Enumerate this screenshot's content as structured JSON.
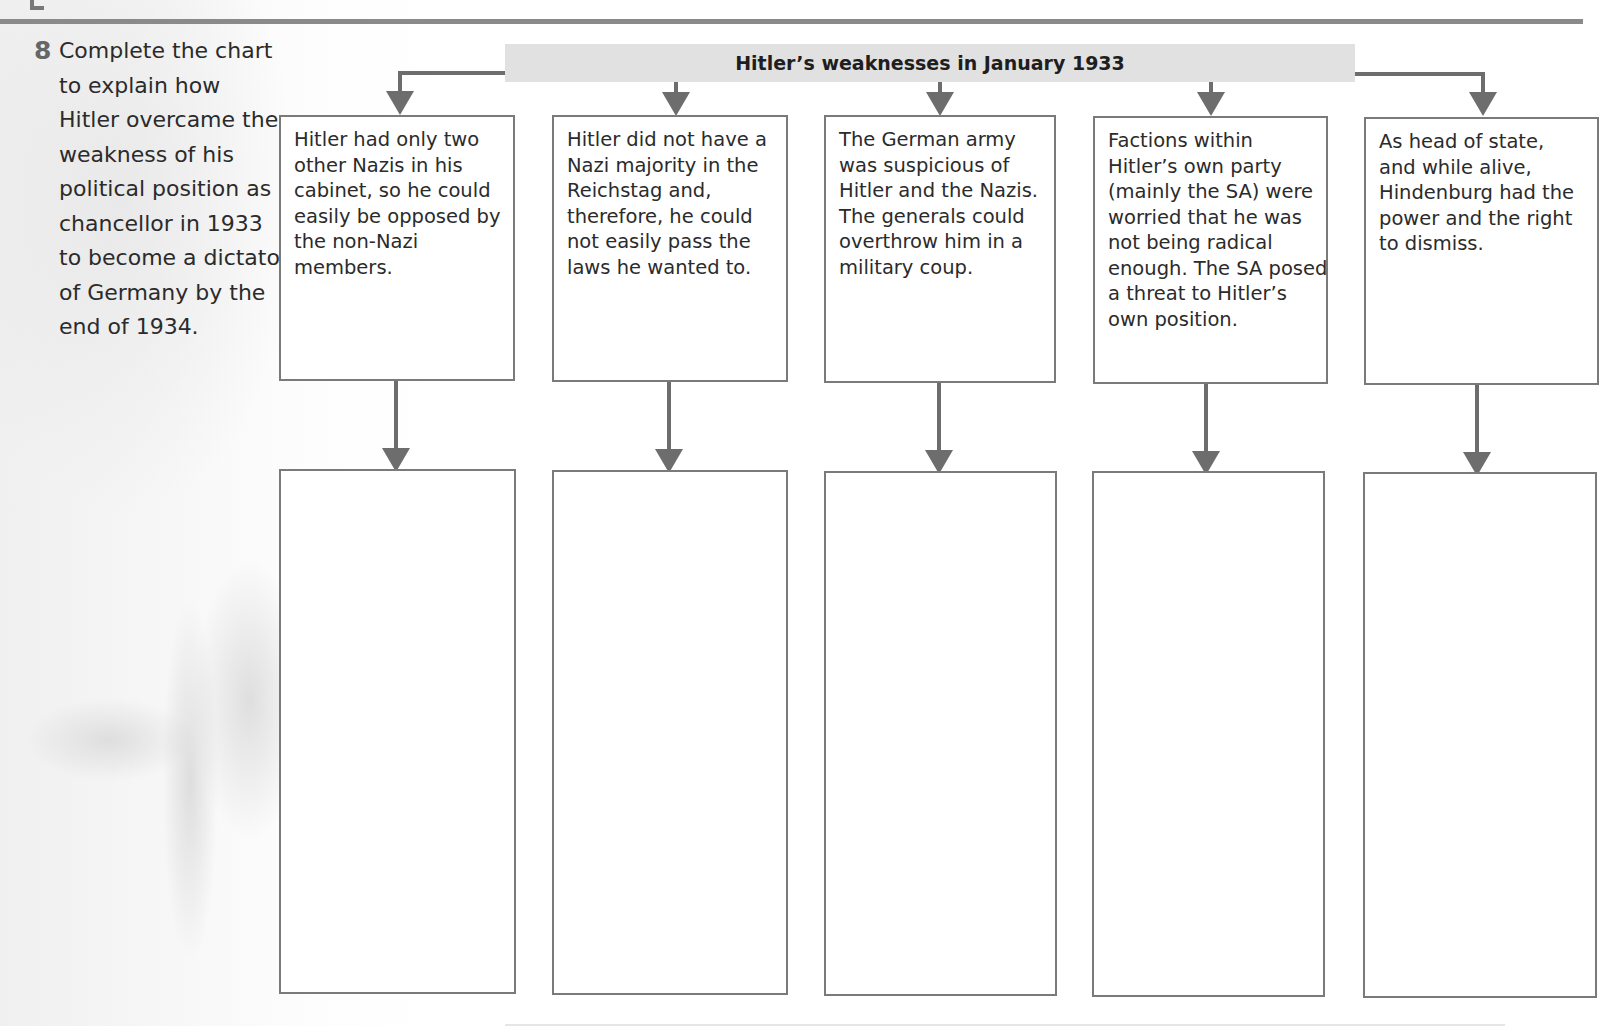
{
  "question": {
    "number": "8",
    "lines": [
      "Complete the chart",
      "to explain how",
      "Hitler overcame the",
      "weakness of his",
      "political position as",
      "chancellor in 1933",
      "to become a dictator",
      "of Germany by the",
      "end of 1934."
    ]
  },
  "chart": {
    "title": "Hitler’s weaknesses in January 1933",
    "weaknesses": [
      {
        "lines": [
          "Hitler had only two",
          "other Nazis in his",
          "cabinet, so he could",
          "easily be opposed by",
          "the non-Nazi",
          "members."
        ]
      },
      {
        "lines": [
          "Hitler did not have a",
          "Nazi majority in the",
          "Reichstag and,",
          "therefore, he could",
          "not easily pass the",
          "laws he wanted to."
        ]
      },
      {
        "lines": [
          "The German army",
          "was suspicious of",
          "Hitler and the Nazis.",
          "The generals could",
          "overthrow him in a",
          "military coup."
        ]
      },
      {
        "lines": [
          "Factions within",
          "Hitler’s own party",
          "(mainly the SA) were",
          "worried that he was",
          "not being radical",
          "enough. The SA posed",
          "a threat to Hitler’s",
          "own position."
        ]
      },
      {
        "lines": [
          "As head of state,",
          "and while alive,",
          "Hindenburg had the",
          "power and the right",
          "to dismiss."
        ]
      }
    ],
    "answers": [
      "",
      "",
      "",
      "",
      ""
    ]
  },
  "colors": {
    "title_bar": "#e1e1e1",
    "connector": "#6d6d6d",
    "box_border": "#7a7a7a"
  }
}
